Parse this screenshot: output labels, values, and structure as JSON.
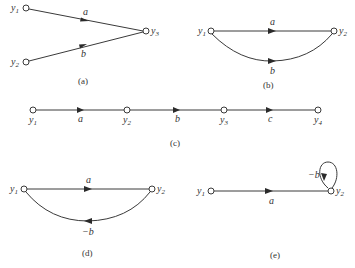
{
  "figure": {
    "panels": [
      {
        "id": "a",
        "caption": "(a)",
        "nodes": [
          "y1",
          "y2",
          "y3"
        ],
        "edges": [
          {
            "from": "y1",
            "to": "y3",
            "gain": "a"
          },
          {
            "from": "y2",
            "to": "y3",
            "gain": "b"
          }
        ]
      },
      {
        "id": "b",
        "caption": "(b)",
        "nodes": [
          "y1",
          "y2"
        ],
        "edges": [
          {
            "from": "y1",
            "to": "y2",
            "gain": "a"
          },
          {
            "from": "y1",
            "to": "y2",
            "gain": "b"
          }
        ]
      },
      {
        "id": "c",
        "caption": "(c)",
        "nodes": [
          "y1",
          "y2",
          "y3",
          "y4"
        ],
        "edges": [
          {
            "from": "y1",
            "to": "y2",
            "gain": "a"
          },
          {
            "from": "y2",
            "to": "y3",
            "gain": "b"
          },
          {
            "from": "y3",
            "to": "y4",
            "gain": "c"
          }
        ]
      },
      {
        "id": "d",
        "caption": "(d)",
        "nodes": [
          "y1",
          "y2"
        ],
        "edges": [
          {
            "from": "y1",
            "to": "y2",
            "gain": "a"
          },
          {
            "from": "y2",
            "to": "y1",
            "gain": "−b"
          }
        ]
      },
      {
        "id": "e",
        "caption": "(e)",
        "nodes": [
          "y1",
          "y2"
        ],
        "edges": [
          {
            "from": "y1",
            "to": "y2",
            "gain": "a"
          },
          {
            "from": "y2",
            "to": "y2",
            "gain": "−b"
          }
        ]
      }
    ]
  },
  "labels": {
    "y": "y",
    "s1": "1",
    "s2": "2",
    "s3": "3",
    "s4": "4",
    "a": "a",
    "b": "b",
    "c": "c",
    "neg_b": "−b",
    "cap_a": "(a)",
    "cap_b": "(b)",
    "cap_c": "(c)",
    "cap_d": "(d)",
    "cap_e": "(e)"
  }
}
